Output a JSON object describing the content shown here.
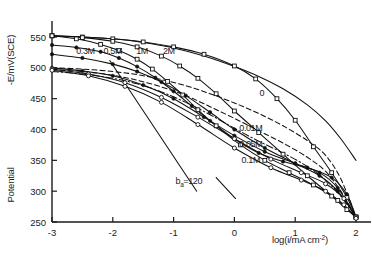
{
  "chart_data": {
    "type": "line",
    "title": "",
    "xlabel": "log(i/mA cm-2)",
    "xlabel_main": "log(i/mA cm",
    "xlabel_sup": "-2",
    "xlabel_close": ")",
    "ylabel": "-E/mV(SCE)",
    "ylabel_secondary": "Potential",
    "xlim": [
      -3,
      2
    ],
    "ylim": [
      250,
      550
    ],
    "xticks": [
      -3,
      -2,
      -1,
      0,
      1,
      2
    ],
    "xtick_labels": [
      "-3",
      "-2",
      "-1",
      "0",
      "1",
      "2"
    ],
    "yticks": [
      250,
      300,
      350,
      400,
      450,
      500,
      550
    ],
    "ytick_labels": [
      "250",
      "300",
      "350",
      "400",
      "450",
      "500",
      "550"
    ],
    "grid": false,
    "legend_position": "inline-annotations",
    "annotations": [
      {
        "text": "b",
        "sub": "a",
        "rest": "=120",
        "x": -0.75,
        "y": 312,
        "name": "tafel-slope-annotation"
      }
    ],
    "series": [
      {
        "name": "2M",
        "label": "2M",
        "label_x": -1.08,
        "label_y": 522,
        "style": "solid",
        "marker": "open-square",
        "color": "#111111",
        "x": [
          -3.0,
          -2.5,
          -2.0,
          -1.5,
          -1.0,
          -0.5,
          0.0,
          0.35,
          0.7,
          1.0,
          1.3,
          1.6,
          1.85,
          2.0
        ],
        "y": [
          552,
          550,
          547,
          542,
          534,
          522,
          503,
          482,
          450,
          415,
          372,
          330,
          290,
          258
        ]
      },
      {
        "name": "1M",
        "label": "1M",
        "label_x": -1.52,
        "label_y": 522,
        "style": "solid",
        "marker": "open-square",
        "color": "#111111",
        "x": [
          -3.0,
          -2.5,
          -2.0,
          -1.6,
          -1.2,
          -0.9,
          -0.6,
          -0.3,
          0.0,
          0.4,
          0.8,
          1.2,
          1.6,
          1.85,
          2.0
        ],
        "y": [
          552,
          549,
          543,
          534,
          519,
          503,
          483,
          458,
          430,
          395,
          360,
          325,
          292,
          270,
          258
        ]
      },
      {
        "name": "0.5M",
        "label": "0.5M",
        "label_x": -2.0,
        "label_y": 522,
        "style": "solid",
        "marker": "open-square",
        "color": "#111111",
        "x": [
          -3.0,
          -2.6,
          -2.2,
          -1.9,
          -1.6,
          -1.35,
          -1.1,
          -0.85,
          -0.6,
          -0.3,
          0.1,
          0.5,
          0.9,
          1.3,
          1.7,
          2.0
        ],
        "y": [
          552,
          547,
          538,
          528,
          514,
          498,
          478,
          456,
          432,
          406,
          375,
          350,
          330,
          310,
          285,
          258
        ]
      },
      {
        "name": "0.3M",
        "label": "0.3M",
        "label_x": -2.45,
        "label_y": 522,
        "style": "solid",
        "marker": "filled-circle",
        "color": "#111111",
        "x": [
          -3.0,
          -2.6,
          -2.2,
          -1.9,
          -1.6,
          -1.3,
          -1.0,
          -0.7,
          -0.4,
          0.0,
          0.4,
          0.8,
          1.2,
          1.6,
          1.85,
          2.0
        ],
        "y": [
          537,
          533,
          526,
          516,
          502,
          484,
          462,
          438,
          414,
          385,
          362,
          348,
          338,
          322,
          295,
          258
        ]
      },
      {
        "name": "0.1M",
        "label": "0.1M",
        "label_x": 0.27,
        "label_y": 345,
        "style": "dash-dot",
        "marker": "none",
        "color": "#111111",
        "x": [
          -3.0,
          -2.5,
          -2.0,
          -1.6,
          -1.2,
          -0.8,
          -0.4,
          0.0,
          0.4,
          0.8,
          1.2,
          1.5,
          1.75,
          2.0
        ],
        "y": [
          494,
          490,
          483,
          474,
          461,
          444,
          424,
          402,
          381,
          362,
          340,
          318,
          292,
          258
        ]
      },
      {
        "name": "0.05M",
        "label": "0.05M",
        "label_x": 0.27,
        "label_y": 371,
        "style": "dashed",
        "marker": "none",
        "color": "#111111",
        "x": [
          -3.0,
          -2.5,
          -2.0,
          -1.6,
          -1.2,
          -0.8,
          -0.4,
          0.0,
          0.4,
          0.8,
          1.2,
          1.5,
          1.75,
          2.0
        ],
        "y": [
          497,
          494,
          488,
          480,
          469,
          455,
          437,
          418,
          398,
          378,
          355,
          332,
          300,
          258
        ]
      },
      {
        "name": "0.01M",
        "label": "0.01M",
        "label_x": 0.27,
        "label_y": 398,
        "style": "dashed",
        "marker": "none",
        "color": "#111111",
        "x": [
          -3.0,
          -2.5,
          -2.0,
          -1.6,
          -1.2,
          -0.8,
          -0.4,
          0.0,
          0.4,
          0.8,
          1.2,
          1.5,
          1.75,
          2.0
        ],
        "y": [
          500,
          498,
          494,
          489,
          481,
          471,
          458,
          443,
          426,
          406,
          382,
          358,
          320,
          258
        ]
      },
      {
        "name": "0",
        "label": "0",
        "label_x": 0.45,
        "label_y": 455,
        "style": "solid",
        "marker": "none",
        "color": "#111111",
        "x": [
          -3.0,
          -2.5,
          -2.0,
          -1.5,
          -1.0,
          -0.5,
          0.0,
          0.4,
          0.8,
          1.2,
          1.5,
          1.75,
          2.0
        ],
        "y": [
          552,
          550,
          547,
          541,
          532,
          519,
          502,
          486,
          466,
          440,
          414,
          385,
          350
        ]
      },
      {
        "name": "baseline-0.1M-lower",
        "label": "",
        "style": "solid",
        "marker": "filled-circle",
        "color": "#111111",
        "x": [
          -3.0,
          -2.5,
          -2.0,
          -1.6,
          -1.2,
          -0.8,
          -0.4,
          0.0,
          0.5,
          1.0,
          1.4,
          1.7,
          2.0
        ],
        "y": [
          522,
          516,
          506,
          494,
          477,
          455,
          428,
          400,
          370,
          345,
          325,
          300,
          258
        ]
      },
      {
        "name": "lower-branch-a",
        "label": "",
        "style": "solid",
        "marker": "filled-circle",
        "color": "#111111",
        "x": [
          -3.0,
          -2.5,
          -2.0,
          -1.5,
          -1.0,
          -0.5,
          0.0,
          0.5,
          1.0,
          1.4,
          1.7,
          2.0
        ],
        "y": [
          500,
          495,
          487,
          472,
          450,
          420,
          390,
          364,
          345,
          330,
          305,
          258
        ]
      },
      {
        "name": "lower-branch-b",
        "label": "",
        "style": "solid",
        "marker": "open-circle",
        "color": "#111111",
        "x": [
          -3.0,
          -2.4,
          -1.8,
          -1.2,
          -0.6,
          0.0,
          0.6,
          1.1,
          1.5,
          1.8,
          2.0
        ],
        "y": [
          498,
          490,
          476,
          452,
          420,
          385,
          352,
          330,
          312,
          288,
          258
        ]
      },
      {
        "name": "lower-branch-c",
        "label": "",
        "style": "solid",
        "marker": "open-circle",
        "color": "#111111",
        "x": [
          -3.0,
          -2.4,
          -1.8,
          -1.2,
          -0.6,
          0.0,
          0.6,
          1.1,
          1.5,
          1.8,
          2.0
        ],
        "y": [
          496,
          487,
          470,
          444,
          408,
          370,
          338,
          318,
          300,
          278,
          256
        ]
      },
      {
        "name": "tafel-line",
        "label": "",
        "style": "solid",
        "marker": "none",
        "color": "#111111",
        "x": [
          -2.05,
          -0.62
        ],
        "y": [
          512,
          300
        ]
      },
      {
        "name": "tafel-line-short",
        "label": "",
        "style": "solid",
        "marker": "none",
        "color": "#111111",
        "x": [
          -0.3,
          0.02
        ],
        "y": [
          322,
          288
        ]
      }
    ]
  }
}
